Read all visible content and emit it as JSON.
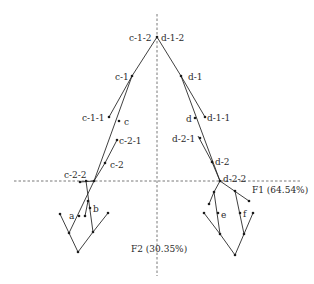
{
  "axes": {
    "f1_label": "F1 (64.54%)",
    "f2_label": "F2 (30.35%)"
  },
  "labels": {
    "c_1_2": "c-1-2",
    "d_1_2": "d-1-2",
    "c_1": "c-1",
    "d_1": "d-1",
    "c_1_1": "c-1-1",
    "c": "c",
    "d": "d",
    "d_1_1": "d-1-1",
    "c_2_1": "c-2-1",
    "d_2_1": "d-2-1",
    "c_2": "c-2",
    "d_2": "d-2",
    "c_2_2": "c-2-2",
    "d_2_2": "d-2-2",
    "a": "a",
    "b": "b",
    "e": "e",
    "f": "f"
  },
  "colors": {
    "line": "#2a2a2a",
    "axis": "#555555",
    "background": "#ffffff"
  }
}
